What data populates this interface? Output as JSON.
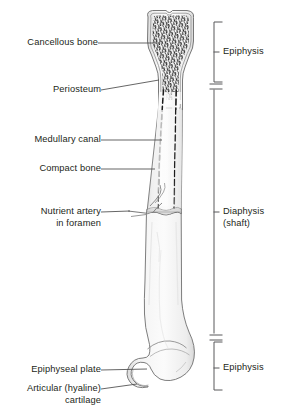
{
  "figure": {
    "background_color": "#ffffff",
    "line_color": "#58595b",
    "text_color": "#231f20",
    "bone_fill": "#f2f2f2",
    "bone_shade": "#e3e3e3"
  },
  "labels": {
    "cancellous_bone": "Cancellous bone",
    "periosteum": "Periosteum",
    "medullary_canal": "Medullary canal",
    "compact_bone": "Compact bone",
    "nutrient_artery_line1": "Nutrient artery",
    "nutrient_artery_line2": "in foramen",
    "epiphyseal_plate": "Epiphyseal plate",
    "articular_cartilage_line1": "Articular (hyaline)",
    "articular_cartilage_line2": "cartilage"
  },
  "regions": {
    "epiphysis_top": "Epiphysis",
    "diaphysis_line1": "Diaphysis",
    "diaphysis_line2": "(shaft)",
    "epiphysis_bottom": "Epiphysis"
  }
}
